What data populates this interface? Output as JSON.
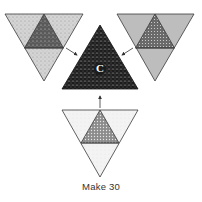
{
  "caption": "Make 30",
  "center_block": {
    "label": "C"
  },
  "colors": {
    "light_fabric": "#d6d6d6",
    "medium_fabric": "#b9b9b9",
    "dark_fabric": "#585858",
    "center_dark": "#1e1e1e",
    "white_fabric": "#f4f4f4",
    "outline": "#3a3a3a"
  },
  "units": [
    {
      "name": "top-left-unit",
      "outer": "light speckled",
      "inner": "dark speckled"
    },
    {
      "name": "top-right-unit",
      "outer": "medium gray",
      "inner": "dark dotted"
    },
    {
      "name": "bottom-unit",
      "outer": "white speckled",
      "inner": "medium dotted"
    }
  ]
}
